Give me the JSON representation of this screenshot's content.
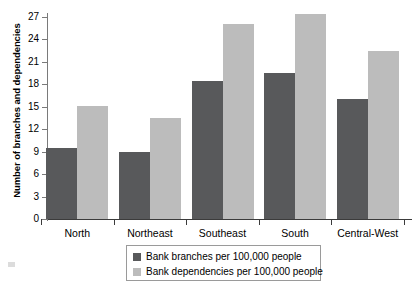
{
  "chart_data": {
    "type": "bar",
    "title": "",
    "xlabel": "",
    "ylabel": "Number of branches and dependencies",
    "categories": [
      "North",
      "Northeast",
      "Southeast",
      "South",
      "Central-West"
    ],
    "series": [
      {
        "name": "Bank branches per 100,000 people",
        "color": "#58595b",
        "values": [
          9.5,
          9.0,
          18.4,
          19.5,
          16.1
        ]
      },
      {
        "name": "Bank dependencies per 100,000 people",
        "color": "#bcbcbc",
        "values": [
          15.1,
          13.5,
          26.0,
          27.4,
          22.5
        ]
      }
    ],
    "ylim": [
      0,
      28.5
    ],
    "yticks": [
      0,
      3,
      6,
      9,
      12,
      15,
      18,
      21,
      24,
      27
    ],
    "ytick_labels": [
      "0",
      "3",
      "6",
      "9",
      "12",
      "15",
      "18",
      "21",
      "24",
      "27"
    ],
    "grid": false,
    "legend_position": "bottom-center"
  },
  "legend": {
    "entries": [
      {
        "label": "Bank branches per 100,000 people",
        "swatch": "dark-square-swatch"
      },
      {
        "label": "Bank dependencies per 100,000 people",
        "swatch": "light-square-swatch"
      }
    ]
  },
  "colors": {
    "series_dark": "#58595b",
    "series_light": "#bcbcbc",
    "axis": "#3b3b3b",
    "background": "#ffffff"
  }
}
